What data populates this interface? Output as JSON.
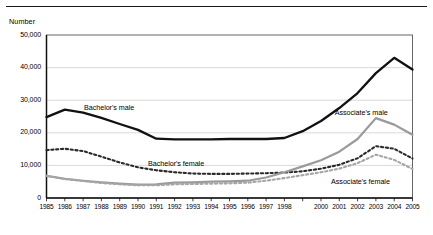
{
  "figure": {
    "axis_title": "Number",
    "has_top_rule": true
  },
  "chart_data": {
    "type": "line",
    "title": "",
    "subtitle": "",
    "xlabel": "",
    "ylabel": "Number",
    "grid": true,
    "legend_position": "inline-annotations",
    "x": [
      1985,
      1986,
      1987,
      1988,
      1989,
      1990,
      1991,
      1992,
      1993,
      1994,
      1995,
      1996,
      1997,
      1998,
      1999,
      2000,
      2001,
      2002,
      2003,
      2004,
      2005
    ],
    "xtick_labels": [
      "1985",
      "1986",
      "1987",
      "1988",
      "1989",
      "1990",
      "1991",
      "1992",
      "1993",
      "1994",
      "1995",
      "1996",
      "1997",
      "1998",
      "",
      "2000",
      "2001",
      "2002",
      "2003",
      "2004",
      "2005"
    ],
    "xlim": [
      1985,
      2005
    ],
    "ylim": [
      0,
      50000
    ],
    "ytick_values": [
      0,
      10000,
      20000,
      30000,
      40000,
      50000
    ],
    "ytick_labels": [
      "0",
      "10,000",
      "20,000",
      "30,000",
      "40,000",
      "50,000"
    ],
    "series": [
      {
        "name": "Bachelor's male",
        "style": "solid",
        "color": "#111111",
        "width": 2.3,
        "label_x": 1987.05,
        "label_y": 27600,
        "values": [
          24800,
          27100,
          26200,
          24600,
          22700,
          20900,
          18200,
          18000,
          18000,
          18000,
          18100,
          18100,
          18100,
          18400,
          20500,
          23600,
          27600,
          32200,
          38300,
          43000,
          39400
        ]
      },
      {
        "name": "Bachelor's female",
        "style": "dotted",
        "color": "#2a2a2a",
        "width": 2.1,
        "label_x": 1990.55,
        "label_y": 10350,
        "values": [
          14700,
          15100,
          14400,
          12700,
          10900,
          9400,
          8500,
          7900,
          7500,
          7400,
          7400,
          7500,
          7600,
          7800,
          8200,
          9000,
          10200,
          12200,
          15900,
          15100,
          12100
        ]
      },
      {
        "name": "Associate's male",
        "style": "solid",
        "color": "#9a9a9a",
        "width": 2.2,
        "label_x": 2000.75,
        "label_y": 26100,
        "values": [
          6800,
          5900,
          5300,
          4800,
          4400,
          4100,
          4200,
          4700,
          4800,
          5000,
          5100,
          5300,
          6300,
          7900,
          9700,
          11600,
          14200,
          18100,
          24500,
          22500,
          19400
        ]
      },
      {
        "name": "Associate's female",
        "style": "dotted",
        "color": "#a6a6a6",
        "width": 2.1,
        "label_x": 2000.55,
        "label_y": 5000,
        "values": [
          6800,
          5800,
          5200,
          4600,
          4200,
          3900,
          3900,
          4200,
          4300,
          4400,
          4500,
          4700,
          5300,
          6100,
          7000,
          7900,
          9000,
          10700,
          13300,
          11700,
          8900
        ]
      }
    ]
  }
}
